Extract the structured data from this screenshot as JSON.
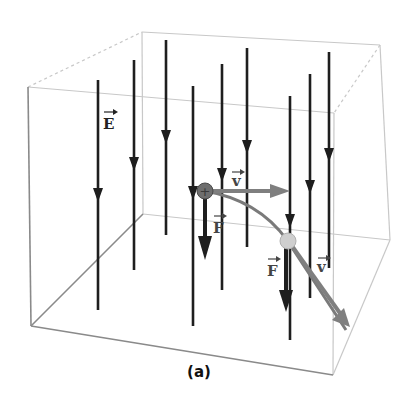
{
  "caption": "(a)",
  "labels": {
    "field": "E",
    "velocity_1": "v",
    "force_1": "F",
    "force_2": "F",
    "velocity_2": "v"
  },
  "particle": {
    "initial_symbol": "+",
    "initial_color": "#6e6e6e",
    "final_color": "#cfcfcf"
  },
  "colors": {
    "field_lines": "#1e1e1e",
    "velocity": "#7f7f7f",
    "force": "#1e1e1e",
    "trajectory": "#7a7a7a",
    "box_edges": "#8a8a8a"
  }
}
